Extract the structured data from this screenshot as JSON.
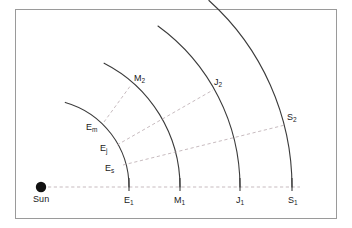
{
  "figure": {
    "background_color": "#ffffff",
    "frame_color": "#9a9a9a",
    "orbit_color": "#3b3b3b",
    "dashed_color": "#b9a9ae",
    "sun_color": "#111111"
  },
  "sun": {
    "label": "Sun",
    "x": 41,
    "y": 187,
    "radius": 5.2
  },
  "baseline": {
    "from_x": 48,
    "to_x": 300,
    "y": 187
  },
  "orbits": [
    {
      "name": "earth-orbit",
      "radius": 88,
      "start_angle_deg": 0,
      "end_angle_deg": 74,
      "baseline_label": "E",
      "baseline_sub": "1",
      "baseline_x": 129,
      "baseline_y": 187
    },
    {
      "name": "mars-orbit",
      "radius": 139,
      "start_angle_deg": 0,
      "end_angle_deg": 63,
      "baseline_label": "M",
      "baseline_sub": "1",
      "baseline_x": 180,
      "baseline_y": 187
    },
    {
      "name": "jupiter-orbit",
      "radius": 199,
      "start_angle_deg": 0,
      "end_angle_deg": 54,
      "baseline_label": "J",
      "baseline_sub": "1",
      "baseline_x": 240,
      "baseline_y": 187
    },
    {
      "name": "saturn-orbit",
      "radius": 251,
      "start_angle_deg": 0,
      "end_angle_deg": 48,
      "baseline_label": "S",
      "baseline_sub": "1",
      "baseline_x": 292,
      "baseline_y": 187
    }
  ],
  "sight_lines": [
    {
      "name": "earth-to-mars",
      "from": {
        "label": "E",
        "sub": "m",
        "x": 104,
        "y": 122
      },
      "to": {
        "label": "M",
        "sub": "2",
        "x": 131,
        "y": 85
      }
    },
    {
      "name": "earth-to-jupiter",
      "from": {
        "label": "E",
        "sub": "j",
        "x": 117,
        "y": 145
      },
      "to": {
        "label": "J",
        "sub": "2",
        "x": 213,
        "y": 90
      }
    },
    {
      "name": "earth-to-saturn",
      "from": {
        "label": "E",
        "sub": "s",
        "x": 123,
        "y": 165
      },
      "to": {
        "label": "S",
        "sub": "2",
        "x": 285,
        "y": 125
      }
    }
  ],
  "point_labels": [
    {
      "name": "label-Em",
      "text": "E",
      "sub": "m",
      "x": 86,
      "y": 123
    },
    {
      "name": "label-Ej",
      "text": "E",
      "sub": "j",
      "x": 100,
      "y": 144
    },
    {
      "name": "label-Es",
      "text": "E",
      "sub": "s",
      "x": 105,
      "y": 164
    },
    {
      "name": "label-M2",
      "text": "M",
      "sub": "2",
      "x": 134,
      "y": 74
    },
    {
      "name": "label-J2",
      "text": "J",
      "sub": "2",
      "x": 214,
      "y": 78
    },
    {
      "name": "label-S2",
      "text": "S",
      "sub": "2",
      "x": 287,
      "y": 113
    },
    {
      "name": "label-E1",
      "text": "E",
      "sub": "1",
      "x": 124,
      "y": 196
    },
    {
      "name": "label-M1",
      "text": "M",
      "sub": "1",
      "x": 174,
      "y": 196
    },
    {
      "name": "label-J1",
      "text": "J",
      "sub": "1",
      "x": 236,
      "y": 196
    },
    {
      "name": "label-S1",
      "text": "S",
      "sub": "1",
      "x": 288,
      "y": 196
    }
  ]
}
